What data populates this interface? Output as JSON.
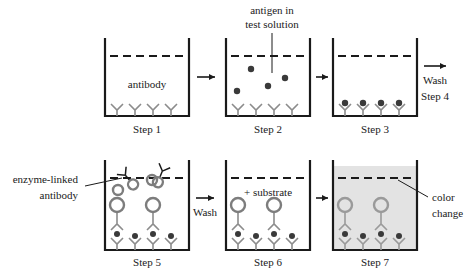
{
  "figure": {
    "type": "process-diagram",
    "background_color": "#ffffff",
    "ink_color": "#1a1a1a",
    "antibody_color": "#8c8c8c",
    "enzyme_circle_color": "#7d7d7d",
    "antigen_dot_color": "#3a3a3a",
    "color_change_fill": "#e3e3e3",
    "step7_complex_color": "#9a9a9a"
  },
  "steps": [
    {
      "id": "step1",
      "caption": "Step 1",
      "inner_label": "antibody",
      "well": {
        "x": 105,
        "y": 38,
        "w": 84,
        "h": 78
      },
      "liquid_line_y": 56,
      "antibodies": [
        117,
        135,
        153,
        171
      ],
      "antigens": [],
      "bound_enzyme": [],
      "free_enzyme": [],
      "color_change": false
    },
    {
      "id": "step2",
      "caption": "Step 2",
      "inner_label": "",
      "well": {
        "x": 226,
        "y": 38,
        "w": 84,
        "h": 78
      },
      "liquid_line_y": 56,
      "antibodies": [
        238,
        256,
        274,
        292
      ],
      "antigens": [
        {
          "x": 251,
          "y": 69
        },
        {
          "x": 285,
          "y": 78
        },
        {
          "x": 268,
          "y": 86
        },
        {
          "x": 237,
          "y": 91
        }
      ],
      "bound_enzyme": [],
      "free_enzyme": [],
      "color_change": false
    },
    {
      "id": "step3",
      "caption": "Step 3",
      "inner_label": "",
      "well": {
        "x": 333,
        "y": 38,
        "w": 84,
        "h": 78
      },
      "liquid_line_y": 56,
      "antibodies": [
        345,
        363,
        381,
        399
      ],
      "antigens": [
        {
          "x": 345,
          "y": 103
        },
        {
          "x": 363,
          "y": 103
        },
        {
          "x": 381,
          "y": 103
        },
        {
          "x": 399,
          "y": 103
        }
      ],
      "bound_enzyme": [],
      "free_enzyme": [],
      "color_change": false
    },
    {
      "id": "step5",
      "caption": "Step 5",
      "inner_label": "",
      "well": {
        "x": 105,
        "y": 160,
        "w": 84,
        "h": 90
      },
      "liquid_line_y": 178,
      "antibodies": [
        117,
        135,
        153,
        171
      ],
      "antigens": [
        {
          "x": 117,
          "y": 228
        },
        {
          "x": 135,
          "y": 228
        },
        {
          "x": 153,
          "y": 228
        },
        {
          "x": 171,
          "y": 228
        }
      ],
      "bound_enzyme": [
        117,
        153
      ],
      "free_enzyme": [
        {
          "x": 127,
          "y": 178,
          "rot": -35
        },
        {
          "x": 160,
          "y": 174,
          "rot": 18
        },
        {
          "x": 120,
          "y": 192,
          "rot": 0
        }
      ],
      "color_change": false
    },
    {
      "id": "step6",
      "caption": "Step 6",
      "inner_label": "+ substrate",
      "well": {
        "x": 226,
        "y": 160,
        "w": 84,
        "h": 90
      },
      "liquid_line_y": 178,
      "antibodies": [
        238,
        256,
        274,
        292
      ],
      "antigens": [
        {
          "x": 238,
          "y": 228
        },
        {
          "x": 256,
          "y": 228
        },
        {
          "x": 274,
          "y": 228
        },
        {
          "x": 292,
          "y": 228
        }
      ],
      "bound_enzyme": [
        238,
        274
      ],
      "free_enzyme": [],
      "color_change": false
    },
    {
      "id": "step7",
      "caption": "Step 7",
      "inner_label": "",
      "well": {
        "x": 333,
        "y": 160,
        "w": 84,
        "h": 90
      },
      "liquid_line_y": 178,
      "antibodies": [
        345,
        363,
        381,
        399
      ],
      "antigens": [
        {
          "x": 345,
          "y": 228
        },
        {
          "x": 363,
          "y": 228
        },
        {
          "x": 381,
          "y": 228
        },
        {
          "x": 399,
          "y": 228
        }
      ],
      "bound_enzyme": [
        345,
        381
      ],
      "free_enzyme": [],
      "color_change": true
    }
  ],
  "annotations": {
    "antigen_label_line1": "antigen in",
    "antigen_label_line2": "test solution",
    "enzyme_label_line1": "enzyme-linked",
    "enzyme_label_line2": "antibody",
    "color_change_line1": "color",
    "color_change_line2": "change",
    "antibody_inner": "antibody",
    "substrate_inner": "+ substrate"
  },
  "transitions": [
    {
      "id": "arrow-1-2",
      "label": ""
    },
    {
      "id": "arrow-2-3",
      "label": ""
    },
    {
      "id": "arrow-3-4",
      "label_line1": "Wash",
      "label_line2": "Step 4"
    },
    {
      "id": "arrow-5-6",
      "label_line1": "Wash",
      "label_line2": ""
    },
    {
      "id": "arrow-6-7",
      "label": ""
    }
  ],
  "captions": {
    "step1": "Step 1",
    "step2": "Step 2",
    "step3": "Step 3",
    "step5": "Step 5",
    "step6": "Step 6",
    "step7": "Step 7"
  }
}
